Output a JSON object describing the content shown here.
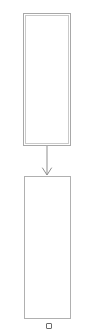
{
  "diagram": {
    "title": "",
    "canvas": {
      "width": 94,
      "height": 335,
      "background": "#ffffff"
    },
    "colors": {
      "node_stroke_top": "#a8a8a8",
      "node_stroke_top_inner": "#c9c9c9",
      "node_stroke_bottom": "#b0b0b0",
      "connector_stroke": "#8f8f8f",
      "handle_stroke": "#6b6b6b",
      "node_fill": "#ffffff"
    },
    "nodes": [
      {
        "id": "node-top",
        "shape": "rectangle",
        "label": "",
        "selected": true,
        "x": 23,
        "y": 13,
        "width": 48,
        "height": 133
      },
      {
        "id": "node-bottom",
        "shape": "rectangle",
        "label": "",
        "selected": false,
        "x": 24,
        "y": 176,
        "width": 47,
        "height": 143
      }
    ],
    "connectors": [
      {
        "id": "connector-top-to-bottom",
        "type": "arrow",
        "label": "",
        "arrowhead": "open-v",
        "from": "node-top",
        "to": "node-bottom",
        "x1": 47,
        "y1": 146,
        "x2": 47,
        "y2": 176
      }
    ],
    "handles": [
      {
        "id": "handle-bottom-center",
        "shape": "square",
        "x": 46,
        "y": 323,
        "size": 6
      }
    ]
  }
}
